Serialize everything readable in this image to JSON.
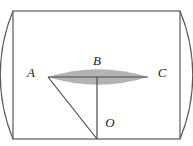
{
  "figure": {
    "background_color": "#ffffff",
    "stroke_color": "#5a5a5a",
    "label_color": "#1a1a1a",
    "lens_fill_color": "#b3b3b3",
    "rectangle": {
      "name": "bounding-rectangle",
      "x": 13,
      "y": 11,
      "width": 167,
      "height": 128
    },
    "points": [
      {
        "id": "A",
        "label": "A",
        "x": 48,
        "y": 77,
        "label_x": 31,
        "label_y": 74
      },
      {
        "id": "B",
        "label": "B",
        "x": 97,
        "y": 77,
        "label_x": 97,
        "label_y": 62
      },
      {
        "id": "C",
        "label": "C",
        "x": 148,
        "y": 77,
        "label_x": 162,
        "label_y": 74
      },
      {
        "id": "O",
        "label": "O",
        "x": 97,
        "y": 139,
        "label_x": 110,
        "label_y": 124
      }
    ],
    "arcs": [
      {
        "name": "arc-left",
        "description": "Quarter circle centered at bottom-right corner, from top-left corner through A to bottom-left corner",
        "center_x": 180,
        "center_y": 139,
        "radius": 167,
        "from_x": 13,
        "from_y": 11,
        "to_x": 13,
        "to_y": 139
      },
      {
        "name": "arc-right",
        "description": "Quarter circle centered at bottom-left corner, from top-right corner through C to bottom-right corner",
        "center_x": 13,
        "center_y": 139,
        "radius": 167,
        "from_x": 180,
        "from_y": 11,
        "to_x": 180,
        "to_y": 139
      }
    ],
    "lens": {
      "name": "shaded-lens-region",
      "left_x": 48,
      "right_x": 148,
      "center_x": 97,
      "center_y": 77,
      "top_y": 56,
      "bottom_y": 91
    },
    "segments": [
      {
        "name": "segment-AC",
        "x1": 48,
        "y1": 77,
        "x2": 148,
        "y2": 77
      },
      {
        "name": "segment-BO",
        "x1": 97,
        "y1": 77,
        "x2": 97,
        "y2": 139
      },
      {
        "name": "segment-AO",
        "x1": 48,
        "y1": 77,
        "x2": 97,
        "y2": 139
      }
    ]
  }
}
